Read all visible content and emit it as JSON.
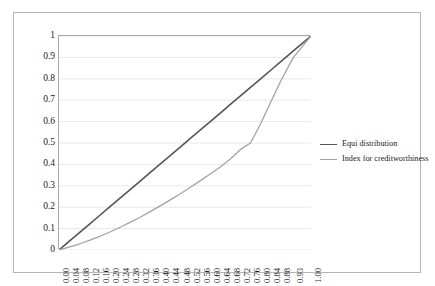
{
  "chart_data": {
    "type": "line",
    "title": "",
    "xlabel": "",
    "ylabel": "",
    "xlim": [
      0,
      1
    ],
    "ylim": [
      0,
      1
    ],
    "grid": true,
    "legend_position": "right",
    "y_ticks": [
      "0",
      "0.1",
      "0.2",
      "0.3",
      "0.4",
      "0.5",
      "0.6",
      "0.7",
      "0.8",
      "0.9",
      "1"
    ],
    "y_tick_values": [
      0,
      0.1,
      0.2,
      0.3,
      0.4,
      0.5,
      0.6,
      0.7,
      0.8,
      0.9,
      1
    ],
    "categories": [
      "0.00",
      "0.04",
      "0.08",
      "0.12",
      "0.16",
      "0.20",
      "0.24",
      "0.28",
      "0.32",
      "0.36",
      "0.40",
      "0.44",
      "0.48",
      "0.52",
      "0.56",
      "0.60",
      "0.64",
      "0.68",
      "0.72",
      "0.76",
      "0.80",
      "0.84",
      "0.88",
      "0.93",
      "1.00"
    ],
    "x": [
      0.0,
      0.04,
      0.08,
      0.12,
      0.16,
      0.2,
      0.24,
      0.28,
      0.32,
      0.36,
      0.4,
      0.44,
      0.48,
      0.52,
      0.56,
      0.6,
      0.64,
      0.68,
      0.72,
      0.76,
      0.8,
      0.84,
      0.88,
      0.93,
      1.0
    ],
    "series": [
      {
        "name": "Equi distribution",
        "color": "#565656",
        "width": 1.6,
        "values": [
          0.0,
          0.04,
          0.08,
          0.12,
          0.16,
          0.2,
          0.24,
          0.28,
          0.32,
          0.36,
          0.4,
          0.44,
          0.48,
          0.52,
          0.56,
          0.6,
          0.64,
          0.68,
          0.72,
          0.76,
          0.8,
          0.84,
          0.88,
          0.93,
          1.0
        ]
      },
      {
        "name": "Index for creditworthiness",
        "color": "#a3a3a3",
        "width": 1.3,
        "values": [
          0.0,
          0.013,
          0.028,
          0.045,
          0.063,
          0.083,
          0.105,
          0.128,
          0.152,
          0.178,
          0.205,
          0.233,
          0.262,
          0.292,
          0.323,
          0.355,
          0.388,
          0.425,
          0.47,
          0.5,
          0.59,
          0.69,
          0.79,
          0.9,
          1.0
        ]
      }
    ]
  },
  "legend": {
    "items": [
      {
        "label": "Equi distribution",
        "color": "#565656"
      },
      {
        "label": "Index for creditworthiness",
        "color": "#a3a3a3"
      }
    ]
  },
  "colors": {
    "background": "#ffffff",
    "frame_border": "#b5b5b5",
    "axis_line": "#a8a8a8",
    "gridline": "#e8e8e8",
    "text": "#1a1a1a",
    "series_equi": "#565656",
    "series_index": "#a3a3a3"
  }
}
